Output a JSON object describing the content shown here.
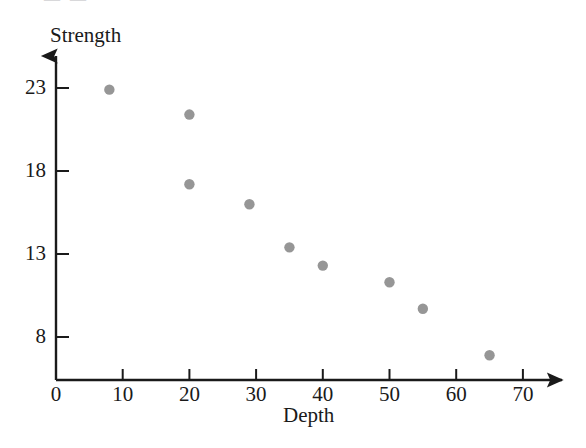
{
  "chart_data": {
    "type": "scatter",
    "title": "",
    "xlabel": "Depth",
    "ylabel": "Strength",
    "xlim": [
      0,
      75
    ],
    "ylim": [
      5.5,
      24.5
    ],
    "grid": false,
    "legend": null,
    "xticks": [
      0,
      10,
      20,
      30,
      40,
      50,
      60,
      70
    ],
    "xtick_labels": [
      "0",
      "10",
      "20",
      "30",
      "40",
      "50",
      "60",
      "70"
    ],
    "yticks": [
      8,
      13,
      18,
      23
    ],
    "ytick_labels": [
      "8",
      "13",
      "18",
      "23"
    ],
    "point_color": "#969696",
    "axis_color": "#1a1a1a",
    "series": [
      {
        "name": "Strength vs Depth",
        "points": [
          {
            "x": 8,
            "y": 22.9
          },
          {
            "x": 20,
            "y": 21.4
          },
          {
            "x": 20,
            "y": 17.2
          },
          {
            "x": 29,
            "y": 16.0
          },
          {
            "x": 35,
            "y": 13.4
          },
          {
            "x": 40,
            "y": 12.3
          },
          {
            "x": 50,
            "y": 11.3
          },
          {
            "x": 55,
            "y": 9.7
          },
          {
            "x": 65,
            "y": 6.9
          }
        ]
      }
    ]
  },
  "artifacts": {
    "top_crop_text": "—  —"
  }
}
